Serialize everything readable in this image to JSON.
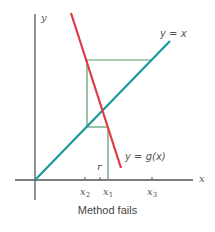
{
  "diagram": {
    "caption": "Method fails",
    "axis_labels": {
      "x": "x",
      "y": "y"
    },
    "curves": [
      {
        "name": "identity",
        "label": "y = x",
        "color": "#1a9a9a"
      },
      {
        "name": "g",
        "label": "y = g(x)",
        "color": "#e03a45"
      }
    ],
    "cobweb_color": "#5a9a6a",
    "tick_labels": {
      "x2_base": "x",
      "x2_sub": "2",
      "r": "r",
      "x1_base": "x",
      "x1_sub": "1",
      "x3_base": "x",
      "x3_sub": "3"
    }
  }
}
